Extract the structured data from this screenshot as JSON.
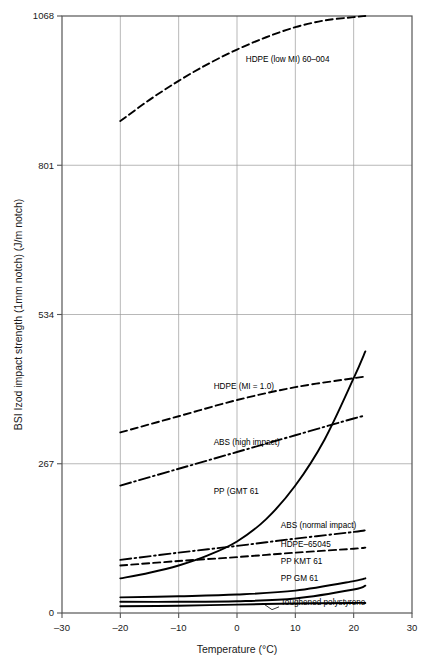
{
  "chart_data": {
    "type": "line",
    "title": "",
    "xlabel": "Temperature (°C)",
    "ylabel": "BSI Izod impact strength (1mm notch) (J/m notch)",
    "xlim": [
      -30,
      30
    ],
    "ylim": [
      0,
      1068
    ],
    "xticks": [
      -30,
      -20,
      -10,
      0,
      10,
      20,
      30
    ],
    "xticklabels": [
      "–30",
      "–20",
      "–10",
      "0",
      "10",
      "20",
      "30"
    ],
    "yticks": [
      0,
      267,
      534,
      801,
      1068
    ],
    "yticklabels": [
      "0",
      "267",
      "534",
      "801",
      "1068"
    ],
    "grid": true,
    "legend_position": "inline-annotations",
    "series": [
      {
        "name": "HDPE (low MI) 60–004",
        "style": "dashed",
        "x": [
          -20,
          -15,
          -10,
          -5,
          0,
          5,
          10,
          15,
          20,
          22
        ],
        "y": [
          880,
          918,
          952,
          982,
          1008,
          1030,
          1048,
          1060,
          1066,
          1068
        ]
      },
      {
        "name": "HDPE (MI = 1.0)",
        "style": "dashed",
        "x": [
          -20,
          -10,
          0,
          10,
          20,
          22
        ],
        "y": [
          323,
          352,
          381,
          404,
          420,
          423
        ]
      },
      {
        "name": "ABS (high impact)",
        "style": "dash-dot",
        "x": [
          -20,
          -10,
          0,
          10,
          20,
          22
        ],
        "y": [
          228,
          258,
          288,
          318,
          348,
          353
        ]
      },
      {
        "name": "PP (GMT 61",
        "style": "solid",
        "x": [
          -20,
          -15,
          -10,
          -5,
          0,
          5,
          10,
          15,
          20,
          22
        ],
        "y": [
          62,
          72,
          85,
          103,
          128,
          168,
          228,
          310,
          420,
          468
        ]
      },
      {
        "name": "ABS (normal impact)",
        "style": "dash-dot",
        "x": [
          -20,
          -10,
          0,
          10,
          20,
          22
        ],
        "y": [
          95,
          108,
          120,
          133,
          145,
          148
        ]
      },
      {
        "name": "HDPE–65045",
        "style": "dashed",
        "x": [
          -20,
          -10,
          0,
          10,
          20,
          22
        ],
        "y": [
          85,
          93,
          100,
          108,
          115,
          117
        ]
      },
      {
        "name": "PP KMT 61",
        "style": "solid",
        "x": [
          -20,
          -10,
          0,
          10,
          20,
          22
        ],
        "y": [
          28,
          30,
          33,
          40,
          57,
          62
        ]
      },
      {
        "name": "PP GM 61",
        "style": "solid",
        "x": [
          -20,
          -10,
          0,
          10,
          20,
          22
        ],
        "y": [
          20,
          20,
          21,
          26,
          42,
          49
        ]
      },
      {
        "name": "Toughened polystyrene",
        "style": "solid",
        "x": [
          -20,
          -10,
          0,
          10,
          20,
          22
        ],
        "y": [
          12,
          13,
          15,
          17,
          18,
          18
        ]
      }
    ],
    "annotations": [
      {
        "text": "HDPE (low MI) 60–004",
        "x": 1.5,
        "y": 985
      },
      {
        "text": "HDPE (MI = 1.0)",
        "x": -4.0,
        "y": 400
      },
      {
        "text": "ABS (high impact)",
        "x": -4.0,
        "y": 300
      },
      {
        "text": "PP (GMT 61",
        "x": -4.0,
        "y": 213
      },
      {
        "text": "ABS (normal impact)",
        "x": 7.5,
        "y": 152
      },
      {
        "text": "HDPE–65045",
        "x": 7.5,
        "y": 118
      },
      {
        "text": "PP KMT 61",
        "x": 7.5,
        "y": 88
      },
      {
        "text": "PP GM 61",
        "x": 7.5,
        "y": 58
      },
      {
        "text": "Toughened polystyrene",
        "x": 7.5,
        "y": 14
      }
    ],
    "colors": {
      "line": "#000000",
      "grid": "#9a9a9a",
      "frame": "#555555",
      "text": "#1a1a1a",
      "background": "#ffffff"
    }
  }
}
